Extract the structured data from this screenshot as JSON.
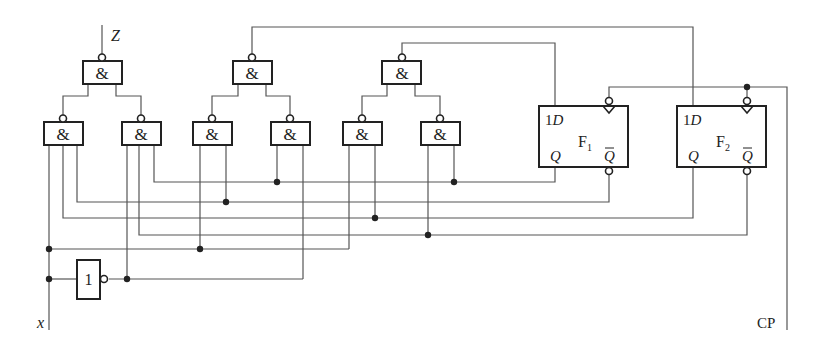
{
  "diagram": {
    "type": "synchronous sequential logic circuit",
    "labels": {
      "output": "Z",
      "input": "x",
      "clock": "CP"
    },
    "gates": {
      "and_symbol": "&",
      "not_symbol": "1",
      "nand_top": [
        {
          "id": "G_out",
          "label": "&"
        },
        {
          "id": "G_d2",
          "label": "&"
        },
        {
          "id": "G_d1",
          "label": "&"
        }
      ],
      "nand_bottom": [
        {
          "id": "G1",
          "label": "&"
        },
        {
          "id": "G2",
          "label": "&"
        },
        {
          "id": "G3",
          "label": "&"
        },
        {
          "id": "G4",
          "label": "&"
        },
        {
          "id": "G5",
          "label": "&"
        },
        {
          "id": "G6",
          "label": "&"
        }
      ],
      "inverter": {
        "id": "NOT_x",
        "label": "1"
      }
    },
    "flipflops": [
      {
        "id": "F1",
        "name": "F",
        "sub": "1",
        "d_label": "1",
        "d_italic": "D",
        "q_label": "Q",
        "qbar_label": "Q"
      },
      {
        "id": "F2",
        "name": "F",
        "sub": "2",
        "d_label": "1",
        "d_italic": "D",
        "q_label": "Q",
        "qbar_label": "Q"
      }
    ]
  }
}
